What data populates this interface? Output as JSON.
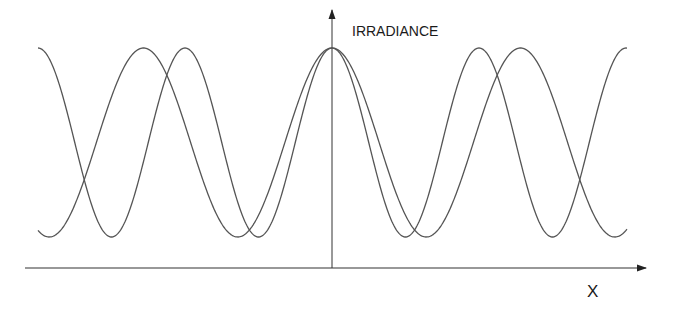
{
  "diagram": {
    "title": "",
    "y_axis_label": "IRRADIANCE",
    "x_axis_label": "X",
    "colors": {
      "curve": "#555555",
      "axis": "#333333",
      "background": "#ffffff"
    },
    "geometry": {
      "origin_x": 332,
      "x_axis_y": 268,
      "x_axis_start": 25,
      "x_axis_end": 646,
      "y_axis_top": 10,
      "curve_peak_y": 48,
      "curve_trough_y": 237,
      "curve_x_start": 38,
      "curve_x_end": 627
    },
    "curves": [
      {
        "name": "wave-1",
        "period_px": 188.5,
        "peak_x_positions": [
          143,
          332,
          520
        ],
        "trough_x_positions": [
          49,
          238,
          426,
          614
        ]
      },
      {
        "name": "wave-2",
        "period_px": 147,
        "peak_x_positions": [
          38,
          185,
          332,
          478,
          625
        ],
        "trough_x_positions": [
          111,
          258,
          405,
          552
        ]
      }
    ]
  }
}
